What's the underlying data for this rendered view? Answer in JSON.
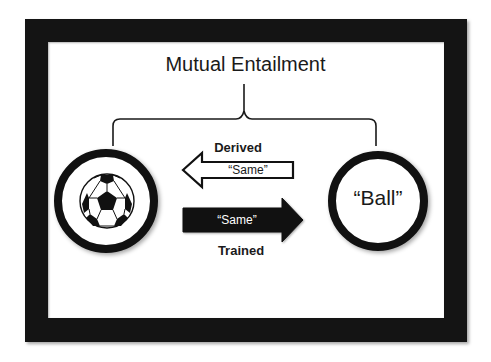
{
  "diagram": {
    "title": "Mutual Entailment",
    "left_node": {
      "type": "image",
      "icon": "soccer-ball-icon"
    },
    "right_node": {
      "type": "word",
      "label": "“Ball”"
    },
    "derived_relation": {
      "label": "Derived",
      "arrow_text": "“Same”",
      "direction": "right-to-left",
      "style": "outline"
    },
    "trained_relation": {
      "label": "Trained",
      "arrow_text": "“Same”",
      "direction": "left-to-right",
      "style": "solid"
    },
    "colors": {
      "frame": "#141414",
      "background": "#ffffff",
      "ink": "#1a1a1a"
    }
  }
}
